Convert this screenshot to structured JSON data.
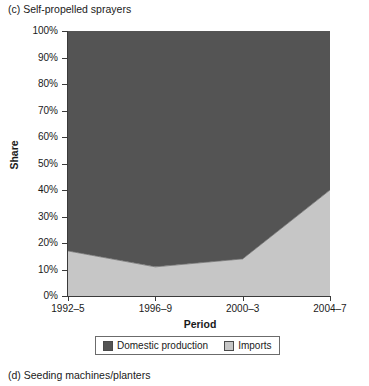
{
  "panels": {
    "current_title": "(c) Self-propelled sprayers",
    "next_title": "(d) Seeding machines/planters"
  },
  "chart_data": {
    "type": "area",
    "stacked": true,
    "percent": true,
    "title": "(c) Self-propelled sprayers",
    "xlabel": "Period",
    "ylabel": "Share",
    "categories": [
      "1992–5",
      "1996–9",
      "2000–3",
      "2004–7"
    ],
    "ylim": [
      0,
      100
    ],
    "ytick_labels": [
      "0%",
      "10%",
      "20%",
      "30%",
      "40%",
      "50%",
      "60%",
      "70%",
      "80%",
      "90%",
      "100%"
    ],
    "ytick_values": [
      0,
      10,
      20,
      30,
      40,
      50,
      60,
      70,
      80,
      90,
      100
    ],
    "grid": false,
    "legend_position": "bottom",
    "series": [
      {
        "name": "Imports",
        "color": "#c6c6c6",
        "values": [
          17,
          11,
          14,
          40
        ]
      },
      {
        "name": "Domestic production",
        "color": "#545454",
        "values": [
          83,
          89,
          86,
          60
        ]
      }
    ],
    "legend_order": [
      "Domestic production",
      "Imports"
    ]
  },
  "colors": {
    "domestic": "#545454",
    "imports": "#c6c6c6",
    "axis": "#3a3a3a",
    "text": "#1a1a1a"
  }
}
